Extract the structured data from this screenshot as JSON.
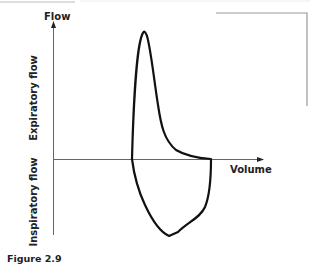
{
  "figure": {
    "caption": "Figure 2.9",
    "y_axis_label": "Flow",
    "x_axis_label": "Volume",
    "upper_region_label": "Expiratory flow",
    "lower_region_label": "Inspiratory flow"
  },
  "colors": {
    "curve": "#111111",
    "axis": "#666666",
    "text": "#222222",
    "frame": "#9a9a9a"
  }
}
